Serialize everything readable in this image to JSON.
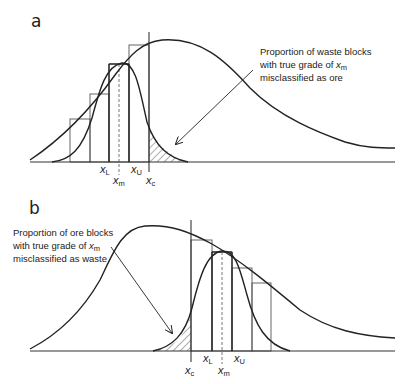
{
  "panels": [
    {
      "id": "a",
      "label": "a",
      "annotation": {
        "line1": "Proportion of waste blocks",
        "line2_prefix": "with true grade of ",
        "line2_var": "x",
        "line2_sub": "m",
        "line3": "misclassified as ore"
      },
      "x_labels": {
        "xL": {
          "var": "x",
          "sub": "L"
        },
        "xm": {
          "var": "x",
          "sub": "m"
        },
        "xU": {
          "var": "x",
          "sub": "U"
        },
        "xc": {
          "var": "x",
          "sub": "c"
        }
      }
    },
    {
      "id": "b",
      "label": "b",
      "annotation": {
        "line1": "Proportion of ore blocks",
        "line2_prefix": "with true grade of ",
        "line2_var": "x",
        "line2_sub": "m",
        "line3": "misclassified as waste"
      },
      "x_labels": {
        "xc": {
          "var": "x",
          "sub": "c"
        },
        "xL": {
          "var": "x",
          "sub": "L"
        },
        "xm": {
          "var": "x",
          "sub": "m"
        },
        "xU": {
          "var": "x",
          "sub": "U"
        }
      }
    }
  ],
  "colors": {
    "line": "#222222",
    "bar_stroke": "#555555",
    "dashed": "#666666",
    "background": "#ffffff"
  }
}
